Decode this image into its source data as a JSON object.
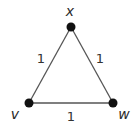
{
  "diagram": {
    "type": "weighted-graph",
    "colors": {
      "edge": "#555555",
      "node": "#111111",
      "text": "#2a2a2a"
    },
    "nodes": [
      {
        "id": "x",
        "label": "x",
        "cx": 71,
        "cy": 27,
        "lx": 70,
        "ly": 16
      },
      {
        "id": "v",
        "label": "v",
        "cx": 29,
        "cy": 103,
        "lx": 15,
        "ly": 119
      },
      {
        "id": "w",
        "label": "w",
        "cx": 113,
        "cy": 103,
        "lx": 124,
        "ly": 119
      }
    ],
    "edges": [
      {
        "from": "v",
        "to": "x",
        "weight": "1",
        "lx": 41,
        "ly": 63
      },
      {
        "from": "x",
        "to": "w",
        "weight": "1",
        "lx": 100,
        "ly": 63
      },
      {
        "from": "v",
        "to": "w",
        "weight": "1",
        "lx": 71,
        "ly": 121
      }
    ]
  }
}
